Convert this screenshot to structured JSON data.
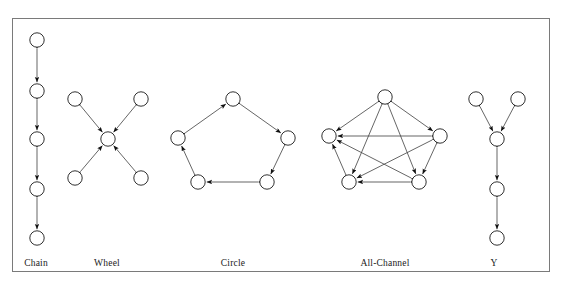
{
  "figure": {
    "border_color": "#7a7a7a",
    "node_stroke": "#1a1a1a",
    "node_fill": "#ffffff",
    "edge_color": "#4a4a4a",
    "arrow_color": "#111111",
    "label_color": "#1a1a1a",
    "node_radius": 7.2,
    "frame": {
      "x": 12,
      "y": 18,
      "width": 538,
      "height": 254
    }
  },
  "networks": [
    {
      "id": "chain",
      "label": "Chain",
      "label_x": 36,
      "label_y": 258,
      "description": "Five nodes in a vertical line, each adjacent pair joined by a bidirectional link",
      "node_count": 5,
      "edge_count": 4,
      "nodes": [
        {
          "id": "c1",
          "x": 37,
          "y": 40
        },
        {
          "id": "c2",
          "x": 37,
          "y": 91
        },
        {
          "id": "c3",
          "x": 37,
          "y": 139
        },
        {
          "id": "c4",
          "x": 37,
          "y": 189
        },
        {
          "id": "c5",
          "x": 37,
          "y": 238
        }
      ],
      "edges": [
        {
          "from": "c1",
          "to": "c2"
        },
        {
          "from": "c2",
          "to": "c3"
        },
        {
          "from": "c3",
          "to": "c4"
        },
        {
          "from": "c4",
          "to": "c5"
        }
      ]
    },
    {
      "id": "wheel",
      "label": "Wheel",
      "label_x": 107,
      "label_y": 258,
      "description": "Four peripheral nodes each joined bidirectionally to one central hub node, forming an X",
      "node_count": 5,
      "edge_count": 4,
      "nodes": [
        {
          "id": "w_tl",
          "x": 75,
          "y": 99
        },
        {
          "id": "w_tr",
          "x": 141,
          "y": 99
        },
        {
          "id": "w_hub",
          "x": 108,
          "y": 139
        },
        {
          "id": "w_bl",
          "x": 75,
          "y": 178
        },
        {
          "id": "w_br",
          "x": 141,
          "y": 178
        }
      ],
      "edges": [
        {
          "from": "w_tl",
          "to": "w_hub"
        },
        {
          "from": "w_tr",
          "to": "w_hub"
        },
        {
          "from": "w_bl",
          "to": "w_hub"
        },
        {
          "from": "w_br",
          "to": "w_hub"
        }
      ]
    },
    {
      "id": "circle",
      "label": "Circle",
      "label_x": 233,
      "label_y": 258,
      "description": "Five nodes arranged as a pentagon ring, each joined bidirectionally to its two neighbours",
      "node_count": 5,
      "edge_count": 5,
      "nodes": [
        {
          "id": "r_top",
          "x": 233,
          "y": 99
        },
        {
          "id": "r_right",
          "x": 288,
          "y": 138
        },
        {
          "id": "r_br",
          "x": 267,
          "y": 182
        },
        {
          "id": "r_bl",
          "x": 198,
          "y": 182
        },
        {
          "id": "r_left",
          "x": 178,
          "y": 138
        }
      ],
      "edges": [
        {
          "from": "r_top",
          "to": "r_right"
        },
        {
          "from": "r_right",
          "to": "r_br"
        },
        {
          "from": "r_br",
          "to": "r_bl"
        },
        {
          "from": "r_bl",
          "to": "r_left"
        },
        {
          "from": "r_left",
          "to": "r_top"
        }
      ]
    },
    {
      "id": "all-channel",
      "label": "All-Channel",
      "label_x": 385,
      "label_y": 258,
      "description": "Five nodes in a pentagon with every possible pair joined bidirectionally (complete graph)",
      "node_count": 5,
      "edge_count": 10,
      "nodes": [
        {
          "id": "a_top",
          "x": 385,
          "y": 97
        },
        {
          "id": "a_right",
          "x": 440,
          "y": 136
        },
        {
          "id": "a_br",
          "x": 419,
          "y": 182
        },
        {
          "id": "a_bl",
          "x": 349,
          "y": 182
        },
        {
          "id": "a_left",
          "x": 329,
          "y": 136
        }
      ],
      "edges": [
        {
          "from": "a_top",
          "to": "a_right"
        },
        {
          "from": "a_top",
          "to": "a_br"
        },
        {
          "from": "a_top",
          "to": "a_bl"
        },
        {
          "from": "a_top",
          "to": "a_left"
        },
        {
          "from": "a_right",
          "to": "a_br"
        },
        {
          "from": "a_right",
          "to": "a_bl"
        },
        {
          "from": "a_right",
          "to": "a_left"
        },
        {
          "from": "a_br",
          "to": "a_bl"
        },
        {
          "from": "a_br",
          "to": "a_left"
        },
        {
          "from": "a_bl",
          "to": "a_left"
        }
      ]
    },
    {
      "id": "y",
      "label": "Y",
      "label_x": 494,
      "label_y": 258,
      "description": "Two top nodes converging on a junction node, which continues down a chain of two further nodes",
      "node_count": 5,
      "edge_count": 4,
      "nodes": [
        {
          "id": "y_tl",
          "x": 476,
          "y": 99
        },
        {
          "id": "y_tr",
          "x": 518,
          "y": 99
        },
        {
          "id": "y_mid",
          "x": 497,
          "y": 139
        },
        {
          "id": "y_low",
          "x": 497,
          "y": 189
        },
        {
          "id": "y_bot",
          "x": 497,
          "y": 238
        }
      ],
      "edges": [
        {
          "from": "y_tl",
          "to": "y_mid"
        },
        {
          "from": "y_tr",
          "to": "y_mid"
        },
        {
          "from": "y_mid",
          "to": "y_low"
        },
        {
          "from": "y_low",
          "to": "y_bot"
        }
      ]
    }
  ]
}
